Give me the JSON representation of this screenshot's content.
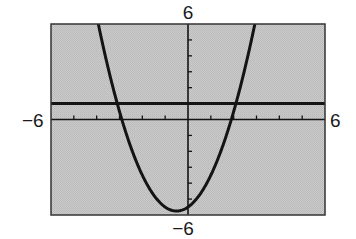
{
  "chart_data": {
    "type": "line",
    "title": "",
    "xlabel": "",
    "ylabel": "",
    "xlim": [
      -6,
      6
    ],
    "ylim": [
      -6,
      6
    ],
    "xscale_ticks": 1,
    "yscale_ticks": 1,
    "grid": false,
    "legend": null,
    "tick_labels": {
      "xmin": "−6",
      "xmax": "6",
      "ymin": "−6",
      "ymax": "6"
    },
    "series": [
      {
        "name": "parabola",
        "kind": "function",
        "expression": "y = x^2 + x - 5.5",
        "coefficients": {
          "a": 1,
          "b": 1,
          "c": -5.5
        },
        "vertex": [
          -0.5,
          -5.75
        ],
        "x_intercepts": [
          -2.9,
          1.9
        ],
        "y_intercept": -5.5
      },
      {
        "name": "horizontal-line",
        "kind": "function",
        "expression": "y = 1",
        "coefficients": {
          "a": 0,
          "b": 0,
          "c": 1
        },
        "intersections_with_parabola": [
          -3.2,
          2.2
        ]
      }
    ]
  },
  "labels": {
    "ymax": "6",
    "ymin": "−6",
    "xmin": "−6",
    "xmax": "6"
  },
  "colors": {
    "plot_background": "#c9c9c9",
    "stipple": "#b5b5b5",
    "line": "#141414",
    "page_background": "#ffffff"
  }
}
